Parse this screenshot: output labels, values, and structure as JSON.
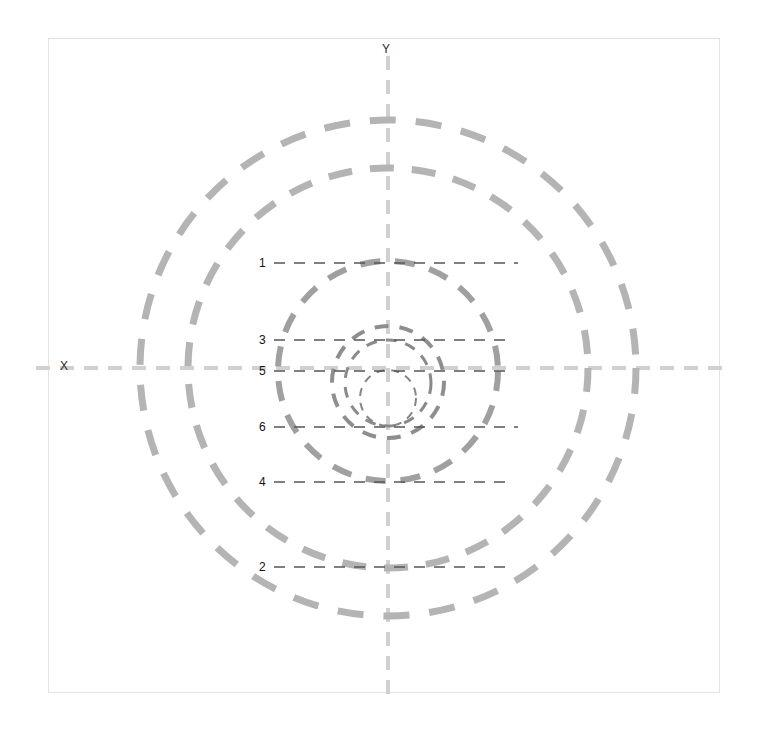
{
  "figure": {
    "title": "",
    "width": 766,
    "height": 733,
    "background": "#ffffff",
    "frame": {
      "x": 48,
      "y": 38,
      "width": 672,
      "height": 655,
      "border_color": "#e3e3e6"
    }
  },
  "axes": {
    "x_label": "X",
    "y_label": "Y",
    "origin": {
      "x": 388,
      "y": 368
    },
    "axis_color": "#d0d0d2",
    "axis_dash": "14 10",
    "axis_width": 4
  },
  "chart_data": {
    "type": "scatter",
    "title": "",
    "xlabel": "X",
    "ylabel": "Y",
    "grid": false,
    "legend": "none",
    "center": {
      "x": 388,
      "y": 368
    },
    "circle_color": "#9a9a9a",
    "circles": [
      {
        "id": "outer-1",
        "cx": 388,
        "cy": 368,
        "r": 248,
        "stroke": "#b4b4b4",
        "width": 7,
        "dash": "26 20"
      },
      {
        "id": "outer-2",
        "cx": 388,
        "cy": 368,
        "r": 200,
        "stroke": "#b4b4b4",
        "width": 7,
        "dash": "24 18"
      },
      {
        "id": "mid-1",
        "cx": 388,
        "cy": 371,
        "r": 110,
        "stroke": "#a0a0a0",
        "width": 6,
        "dash": "20 15"
      },
      {
        "id": "mid-2",
        "cx": 388,
        "cy": 382,
        "r": 56,
        "stroke": "#8e8e8e",
        "width": 4,
        "dash": "14 11"
      },
      {
        "id": "inner-1",
        "cx": 388,
        "cy": 383,
        "r": 43,
        "stroke": "#8a8a8a",
        "width": 3,
        "dash": "11 9"
      },
      {
        "id": "inner-2",
        "cx": 388,
        "cy": 398,
        "r": 28,
        "stroke": "#858585",
        "width": 2,
        "dash": "8 7"
      }
    ],
    "leaders": [
      {
        "label": "1",
        "y": 263,
        "x_start": 274,
        "x_end": 518,
        "label_x": 259,
        "label_y": 257
      },
      {
        "label": "3",
        "y": 340,
        "x_start": 274,
        "x_end": 510,
        "label_x": 259,
        "label_y": 334
      },
      {
        "label": "5",
        "y": 371,
        "x_start": 274,
        "x_end": 510,
        "label_x": 259,
        "label_y": 365
      },
      {
        "label": "6",
        "y": 427,
        "x_start": 274,
        "x_end": 518,
        "label_x": 259,
        "label_y": 421
      },
      {
        "label": "4",
        "y": 482,
        "x_start": 274,
        "x_end": 510,
        "label_x": 259,
        "label_y": 476
      },
      {
        "label": "2",
        "y": 567,
        "x_start": 274,
        "x_end": 510,
        "label_x": 259,
        "label_y": 561
      }
    ],
    "leader_color": "#555555",
    "leader_dash": "11 9",
    "leader_width": 1.4
  }
}
